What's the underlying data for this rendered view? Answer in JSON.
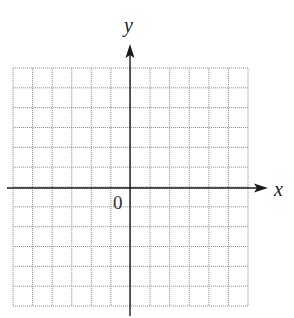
{
  "diagram": {
    "type": "coordinate-plane",
    "grid": {
      "columns": 12,
      "rows": 12,
      "left": 13,
      "top": 68,
      "right": 248,
      "bottom": 306,
      "line_color": "#9a9a9a",
      "line_style": "dotted"
    },
    "axes": {
      "color": "#1a1a1a",
      "x_axis": {
        "label": "x",
        "y": 188,
        "from": 7,
        "to": 268,
        "arrow": "right"
      },
      "y_axis": {
        "label": "y",
        "x": 130,
        "from": 316,
        "to": 44,
        "arrow": "up"
      }
    },
    "origin_label": "0"
  }
}
